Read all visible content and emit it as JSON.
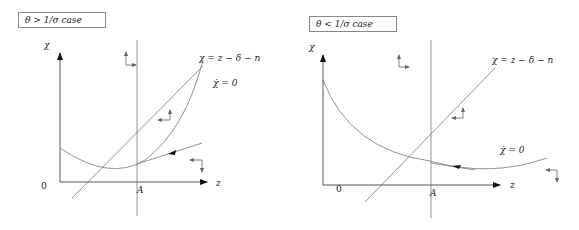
{
  "panels": [
    {
      "case_label": "θ > 1/σ case",
      "y_axis_label": "χ",
      "x_axis_label": "z",
      "origin_label": "0",
      "point_label": "A",
      "line_label": "χ = z − δ − n",
      "curve_label": "χ̇ = 0"
    },
    {
      "case_label": "θ < 1/σ case",
      "y_axis_label": "χ",
      "x_axis_label": "z",
      "origin_label": "0",
      "point_label": "A",
      "line_label": "χ = z − δ − n",
      "curve_label": "χ̇ = 0"
    }
  ],
  "colors": {
    "line": "#777777",
    "axis": "#555555",
    "arrow": "#111111"
  }
}
